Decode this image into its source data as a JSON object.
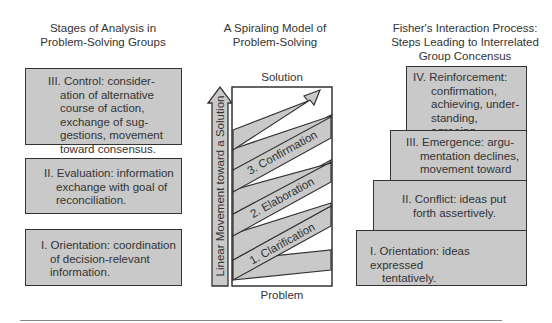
{
  "left_panel": {
    "title_line1": "Stages of Analysis in",
    "title_line2": "Problem-Solving Groups",
    "boxes": [
      {
        "label": "III. Control: consider-",
        "lines": [
          "ation of alternative",
          "course of action,",
          "exchange of sug-",
          "gestions, movement",
          "toward consensus."
        ]
      },
      {
        "label": "II. Evaluation: information",
        "lines": [
          "exchange with goal of",
          "reconciliation."
        ]
      },
      {
        "label": "I. Orientation: coordination",
        "lines": [
          "of decision-relevant",
          "information."
        ]
      }
    ]
  },
  "center_panel": {
    "title_line1": "A Spiraling Model of",
    "title_line2": "Problem-Solving",
    "top_label": "Solution",
    "bottom_label": "Problem",
    "vertical_arrow_label": "Linear Movement toward a Solution",
    "spiral_bands": [
      "1. Clarification",
      "2. Elaboration",
      "3. Confirmation"
    ]
  },
  "right_panel": {
    "title_line1": "Fisher's Interaction Process:",
    "title_line2": "Steps Leading to Interrelated",
    "title_line3": "Group Concensus",
    "steps": [
      {
        "label": "IV. Reinforcement:",
        "lines": [
          "confirmation,",
          "achieving, under-",
          "standing, agreeing,",
          "little dissent."
        ]
      },
      {
        "label": "III. Emergence: argu-",
        "lines": [
          "mentation declines,",
          "movement toward",
          "consensus."
        ]
      },
      {
        "label": "II. Conflict: ideas put",
        "lines": [
          "forth assertively."
        ]
      },
      {
        "label": "I. Orientation: ideas expressed",
        "lines": [
          "tentatively."
        ]
      }
    ]
  },
  "colors": {
    "box_fill": "#c9c9c9",
    "border": "#333333",
    "text": "#333333"
  }
}
